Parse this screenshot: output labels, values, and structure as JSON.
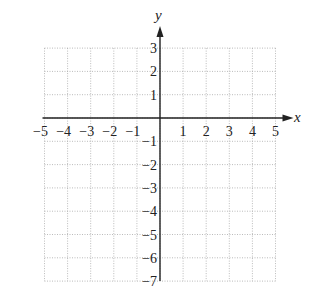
{
  "chart_data": {
    "type": "scatter",
    "title": "",
    "xlabel": "x",
    "ylabel": "y",
    "xlim": [
      -5,
      5
    ],
    "ylim": [
      -7,
      3
    ],
    "grid": true,
    "x_ticks": [
      "−5",
      "−4",
      "−3",
      "−2",
      "−1",
      "1",
      "2",
      "3",
      "4",
      "5"
    ],
    "y_ticks": [
      "3",
      "2",
      "1",
      "−1",
      "−2",
      "−3",
      "−4",
      "−5",
      "−6",
      "−7"
    ],
    "series": []
  },
  "axes": {
    "x_label": "x",
    "y_label": "y"
  }
}
